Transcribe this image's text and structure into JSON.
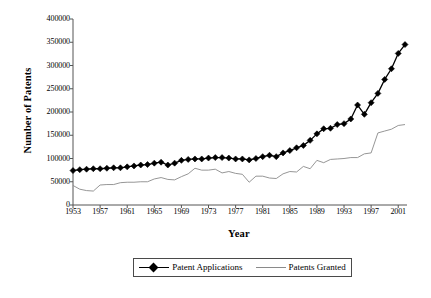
{
  "chart_data": {
    "type": "line",
    "title": "",
    "xlabel": "Year",
    "ylabel": "Number of Patents",
    "xlim": [
      1953,
      2002
    ],
    "ylim": [
      0,
      400000
    ],
    "grid": false,
    "legend_position": "bottom",
    "y_ticks": [
      400000,
      350000,
      300000,
      250000,
      200000,
      150000,
      100000,
      50000,
      0
    ],
    "y_tick_labels": [
      "400000",
      "350000",
      "300000",
      "250000",
      "200000",
      "150000",
      "100000",
      "50000",
      "0"
    ],
    "x_ticks": [
      1953,
      1957,
      1961,
      1965,
      1969,
      1973,
      1977,
      1981,
      1985,
      1989,
      1993,
      1997,
      2001
    ],
    "x_tick_labels": [
      "1953",
      "1957",
      "1961",
      "1965",
      "1969",
      "1973",
      "1977",
      "1981",
      "1985",
      "1989",
      "1993",
      "1997",
      "2001"
    ],
    "x": [
      1953,
      1954,
      1955,
      1956,
      1957,
      1958,
      1959,
      1960,
      1961,
      1962,
      1963,
      1964,
      1965,
      1966,
      1967,
      1968,
      1969,
      1970,
      1971,
      1972,
      1973,
      1974,
      1975,
      1976,
      1977,
      1978,
      1979,
      1980,
      1981,
      1982,
      1983,
      1984,
      1985,
      1986,
      1987,
      1988,
      1989,
      1990,
      1991,
      1992,
      1993,
      1994,
      1995,
      1996,
      1997,
      1998,
      1999,
      2000,
      2001,
      2002
    ],
    "series": [
      {
        "name": "Patent Applications",
        "color": "#000000",
        "marker": "diamond",
        "values": [
          74000,
          76000,
          77000,
          78000,
          78000,
          79000,
          80000,
          80000,
          82000,
          84000,
          86000,
          87000,
          90000,
          92000,
          86000,
          90000,
          96000,
          98000,
          99000,
          99000,
          101000,
          102000,
          102000,
          101000,
          99000,
          99000,
          97000,
          100000,
          104000,
          107000,
          104000,
          112000,
          117000,
          123000,
          128000,
          139000,
          153000,
          164000,
          165000,
          173000,
          175000,
          185000,
          215000,
          195000,
          220000,
          240000,
          270000,
          293000,
          326000,
          345000
        ]
      },
      {
        "name": "Patents Granted",
        "color": "#8a8a8a",
        "marker": "none",
        "values": [
          42000,
          34000,
          31000,
          30000,
          43000,
          44000,
          44000,
          48000,
          49000,
          49000,
          50000,
          50000,
          56000,
          59000,
          55000,
          54000,
          61000,
          67000,
          79000,
          75000,
          75000,
          77000,
          69000,
          72000,
          68000,
          66000,
          49000,
          62000,
          62000,
          58000,
          57000,
          67000,
          72000,
          71000,
          83000,
          78000,
          96000,
          91000,
          98000,
          99000,
          100000,
          102000,
          102000,
          110000,
          112000,
          155000,
          159000,
          163000,
          171000,
          173000
        ]
      }
    ]
  },
  "legend": {
    "items": [
      {
        "label": "Patent Applications"
      },
      {
        "label": "Patents Granted"
      }
    ]
  }
}
